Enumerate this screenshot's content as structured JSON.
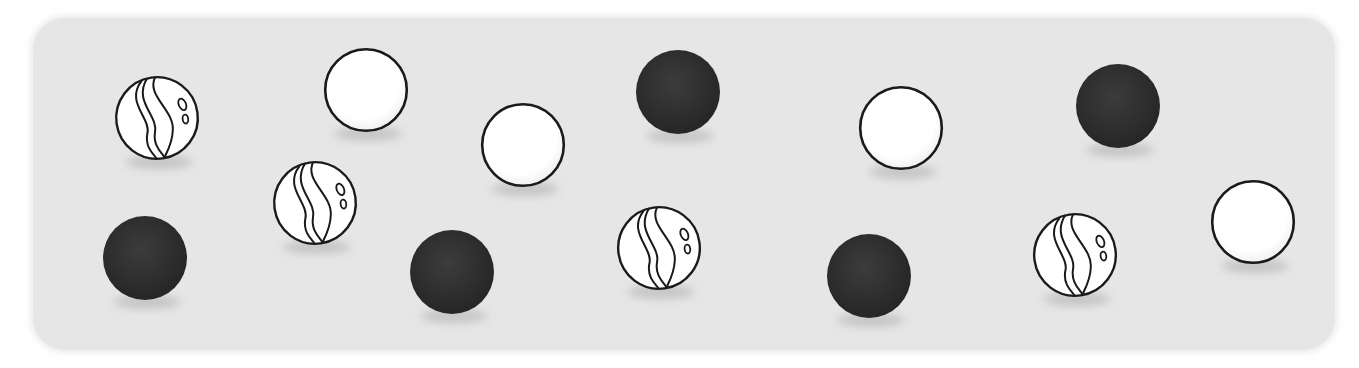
{
  "scene": {
    "background_color": "#e6e6e6",
    "marble_radius": 42,
    "colors": {
      "black": "#2f2f2f",
      "white": "#ffffff",
      "outline": "#1a1a1a",
      "shadow": "#bdbdbd"
    },
    "marbles": [
      {
        "type": "striped",
        "x": 157,
        "y": 118
      },
      {
        "type": "white",
        "x": 366,
        "y": 90
      },
      {
        "type": "white",
        "x": 523,
        "y": 145
      },
      {
        "type": "black",
        "x": 678,
        "y": 92
      },
      {
        "type": "white",
        "x": 901,
        "y": 128
      },
      {
        "type": "black",
        "x": 1118,
        "y": 106
      },
      {
        "type": "black",
        "x": 145,
        "y": 258
      },
      {
        "type": "striped",
        "x": 315,
        "y": 203
      },
      {
        "type": "black",
        "x": 452,
        "y": 272
      },
      {
        "type": "striped",
        "x": 659,
        "y": 248
      },
      {
        "type": "black",
        "x": 869,
        "y": 276
      },
      {
        "type": "striped",
        "x": 1075,
        "y": 255
      },
      {
        "type": "white",
        "x": 1253,
        "y": 222
      }
    ],
    "counts": {
      "striped": 4,
      "white": 4,
      "black": 5,
      "total": 13
    }
  }
}
